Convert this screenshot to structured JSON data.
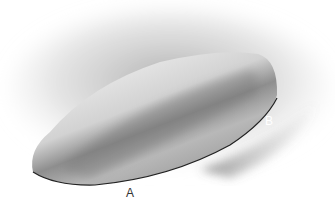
{
  "figure": {
    "labels": [
      {
        "id": "A",
        "text": "A"
      },
      {
        "id": "B",
        "text": "B"
      }
    ]
  }
}
